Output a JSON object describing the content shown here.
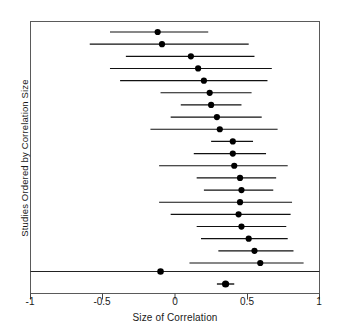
{
  "figure": {
    "kind": "forest-plot",
    "xlabel": "Size of Correlation",
    "ylabel": "Studies Ordered by Correlation Size",
    "line_color": "#111111",
    "marker_color": "#000000",
    "frame_color": "#555555",
    "background": "#ffffff"
  },
  "chart_data": {
    "type": "scatter",
    "title": "",
    "xlabel": "Size of Correlation",
    "ylabel": "Studies Ordered by Correlation Size",
    "xlim": [
      -1,
      1
    ],
    "xticks": [
      -1,
      -0.5,
      0,
      0.5,
      1
    ],
    "xticklabels": [
      "-1",
      "-0.5",
      "0",
      "0.5",
      "1"
    ],
    "grid": false,
    "legend": null,
    "orientation": "horizontal-intervals",
    "series": [
      {
        "name": "Individual studies (ordered by correlation size)",
        "point_estimates": [
          -0.12,
          -0.09,
          0.11,
          0.16,
          0.2,
          0.24,
          0.25,
          0.29,
          0.31,
          0.4,
          0.4,
          0.41,
          0.45,
          0.46,
          0.45,
          0.44,
          0.46,
          0.51,
          0.55,
          0.59
        ],
        "ci_low": [
          -0.45,
          -0.59,
          -0.34,
          -0.45,
          -0.38,
          -0.1,
          0.04,
          -0.03,
          -0.17,
          0.25,
          0.13,
          -0.11,
          0.15,
          0.2,
          -0.11,
          -0.03,
          0.15,
          0.18,
          0.3,
          0.1
        ],
        "ci_high": [
          0.23,
          0.51,
          0.55,
          0.67,
          0.64,
          0.53,
          0.46,
          0.6,
          0.71,
          0.54,
          0.63,
          0.78,
          0.7,
          0.68,
          0.81,
          0.8,
          0.77,
          0.78,
          0.82,
          0.89
        ]
      },
      {
        "name": "Reference point on divider",
        "point_estimates": [
          -0.1
        ],
        "ci_low": [
          -0.1
        ],
        "ci_high": [
          -0.1
        ]
      },
      {
        "name": "Summary / overall estimate",
        "point_estimates": [
          0.35
        ],
        "ci_low": [
          0.29
        ],
        "ci_high": [
          0.41
        ]
      }
    ],
    "n_studies": 20
  },
  "axes": {
    "x_tick_labels": [
      {
        "value": -1,
        "text": "-1"
      },
      {
        "value": -0.5,
        "text": "-0.5"
      },
      {
        "value": 0,
        "text": "0"
      },
      {
        "value": 0.5,
        "text": "0.5"
      },
      {
        "value": 1,
        "text": "1"
      }
    ]
  }
}
